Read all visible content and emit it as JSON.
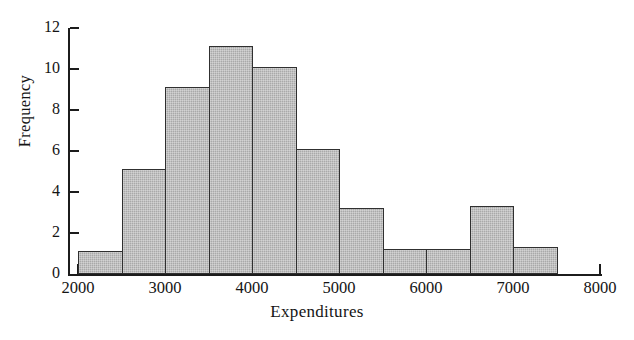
{
  "chart_data": {
    "type": "bar",
    "title": "",
    "xlabel": "Expenditures",
    "ylabel": "Frequency",
    "xlim": [
      2000,
      8000
    ],
    "ylim": [
      0,
      12
    ],
    "grid": false,
    "legend": null,
    "bin_width": 500,
    "x_tick_labels": [
      "2000",
      "3000",
      "4000",
      "5000",
      "6000",
      "7000",
      "8000"
    ],
    "x_tick_values": [
      2000,
      3000,
      4000,
      5000,
      6000,
      7000,
      8000
    ],
    "x_minor_tick_values": [
      2000,
      2500,
      3000,
      3500,
      4000,
      4500,
      5000,
      5500,
      6000,
      6500,
      7000,
      7500,
      8000
    ],
    "y_tick_labels": [
      "0",
      "2",
      "4",
      "6",
      "8",
      "10",
      "12"
    ],
    "y_tick_values": [
      0,
      2,
      4,
      6,
      8,
      10,
      12
    ],
    "bin_edges": [
      2000,
      2500,
      3000,
      3500,
      4000,
      4500,
      5000,
      5500,
      6000,
      6500,
      7000,
      7500
    ],
    "categories": [
      "2000-2500",
      "2500-3000",
      "3000-3500",
      "3500-4000",
      "4000-4500",
      "4500-5000",
      "5000-5500",
      "5500-6000",
      "6000-6500",
      "6500-7000",
      "7000-7500"
    ],
    "values": [
      1.1,
      5.1,
      9.1,
      11.1,
      10.1,
      6.1,
      3.2,
      1.2,
      1.2,
      3.3,
      1.3
    ],
    "bar_fill_color": "#a9a9a9",
    "bar_edge_color": "#303030",
    "axis_color": "#1c1c1c",
    "background_color": "#ffffff"
  }
}
